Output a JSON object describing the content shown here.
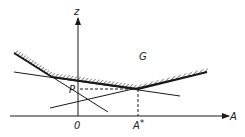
{
  "diagram": {
    "type": "geometric-plot",
    "colors": {
      "ink": "#1a1a1a",
      "background": "#ffffff"
    },
    "axes": {
      "horizontal": {
        "label": "A",
        "from": [
          10,
          116
        ],
        "to": [
          229,
          116
        ]
      },
      "vertical": {
        "label": "z",
        "from": [
          78,
          116
        ],
        "to": [
          78,
          17
        ]
      },
      "origin_label": "0"
    },
    "labels": {
      "region": "G",
      "point_p": "P",
      "a_star": "A*",
      "a_star_main": "A",
      "a_star_sup": "*"
    },
    "envelope": {
      "description": "upper boundary of region G (hatched)",
      "points": [
        [
          14,
          53
        ],
        [
          52,
          77
        ],
        [
          138,
          89
        ],
        [
          207,
          72
        ]
      ]
    },
    "lines": [
      {
        "name": "line-1",
        "from": [
          14,
          72
        ],
        "to": [
          180,
          96
        ]
      },
      {
        "name": "line-2",
        "from": [
          14,
          53
        ],
        "to": [
          108,
          112
        ]
      },
      {
        "name": "line-3",
        "from": [
          50,
          108
        ],
        "to": [
          207,
          72
        ]
      }
    ],
    "dashed_guides": [
      {
        "name": "p-to-min",
        "from": [
          80,
          89
        ],
        "to": [
          138,
          89
        ]
      },
      {
        "name": "min-to-a-star",
        "from": [
          138,
          89
        ],
        "to": [
          138,
          116
        ]
      }
    ],
    "minimum_point": [
      138,
      89
    ]
  }
}
